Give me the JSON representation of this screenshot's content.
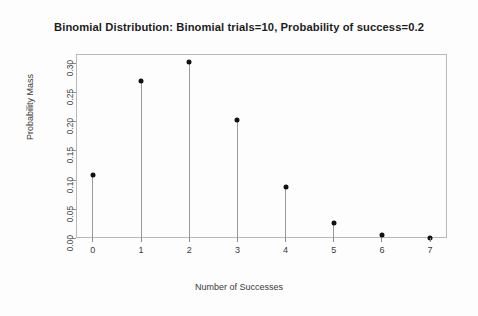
{
  "chart_data": {
    "type": "scatter",
    "title": "Binomial Distribution:  Binomial trials=10, Probability of success=0.2",
    "xlabel": "Number of Successes",
    "ylabel": "Probability Mass",
    "categories": [
      "0",
      "1",
      "2",
      "3",
      "4",
      "5",
      "6",
      "7"
    ],
    "x": [
      0,
      1,
      2,
      3,
      4,
      5,
      6,
      7
    ],
    "values": [
      0.1074,
      0.2684,
      0.302,
      0.2013,
      0.0881,
      0.0264,
      0.0055,
      0.0008
    ],
    "xtick_labels": [
      "0",
      "1",
      "2",
      "3",
      "4",
      "5",
      "6",
      "7"
    ],
    "ytick_labels": [
      "0.00",
      "0.05",
      "0.10",
      "0.15",
      "0.20",
      "0.25",
      "0.30"
    ],
    "ytick_values": [
      0.0,
      0.05,
      0.1,
      0.15,
      0.2,
      0.25,
      0.3
    ],
    "xlim": [
      -0.35,
      7.35
    ],
    "ylim": [
      0.0,
      0.315
    ],
    "grid": false,
    "legend": null,
    "marker_color": "#111111",
    "stem_color": "#9a9a9a",
    "frame_color": "#b9b9b9",
    "background": "#fdfdfd",
    "style": "stem-plot with filled circular markers",
    "distribution": {
      "name": "Binomial",
      "trials": 10,
      "probability_of_success": 0.2
    }
  }
}
